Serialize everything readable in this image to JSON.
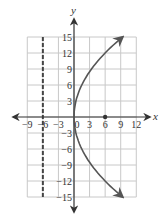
{
  "chart_data": {
    "type": "line",
    "title": "",
    "xlabel": "x",
    "ylabel": "y",
    "xlim": [
      -9,
      12
    ],
    "ylim": [
      -15,
      15
    ],
    "grid": true,
    "x_ticks": [
      -9,
      -6,
      -3,
      0,
      3,
      6,
      9,
      12
    ],
    "x_tick_labels": [
      "−9",
      "−6",
      "−3",
      "0",
      "3",
      "6",
      "9",
      "12"
    ],
    "y_ticks": [
      15,
      12,
      9,
      6,
      3,
      -3,
      -6,
      -9,
      -12,
      -15
    ],
    "y_tick_labels": [
      "15",
      "12",
      "9",
      "6",
      "3",
      "−3",
      "−6",
      "−9",
      "−12",
      "−15"
    ],
    "series": [
      {
        "name": "parabola",
        "equation": "x = y^2 / 24",
        "style": "solid",
        "arrows": "both-ends",
        "points": [
          {
            "x": 9.4,
            "y": -15
          },
          {
            "x": 6,
            "y": -12
          },
          {
            "x": 3.4,
            "y": -9
          },
          {
            "x": 1.5,
            "y": -6
          },
          {
            "x": 0.4,
            "y": -3
          },
          {
            "x": 0,
            "y": 0
          },
          {
            "x": 0.4,
            "y": 3
          },
          {
            "x": 1.5,
            "y": 6
          },
          {
            "x": 3.4,
            "y": 9
          },
          {
            "x": 6,
            "y": 12
          },
          {
            "x": 9.4,
            "y": 15
          }
        ]
      },
      {
        "name": "directrix",
        "equation": "x = -6",
        "style": "dashed",
        "points": [
          {
            "x": -6,
            "y": -15
          },
          {
            "x": -6,
            "y": 15
          }
        ]
      }
    ],
    "annotations": [
      {
        "type": "point",
        "label": "focus",
        "x": 6,
        "y": 0
      }
    ],
    "colors": {
      "curve": "#555555",
      "axis": "#333333",
      "grid": "#c8c8c8",
      "directrix": "#444444"
    }
  }
}
